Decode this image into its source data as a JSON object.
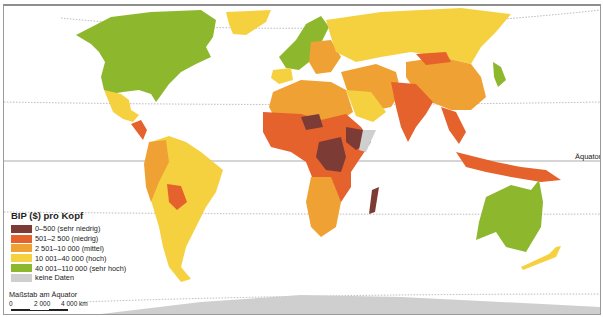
{
  "map": {
    "title": "BIP ($) pro Kopf",
    "equator_label": "Äquator",
    "legend": {
      "title": "BIP ($) pro Kopf",
      "items": [
        {
          "label": "0–500 (sehr niedrig)",
          "color": "#7d3b36"
        },
        {
          "label": "501–2 500 (niedrig)",
          "color": "#e5622c"
        },
        {
          "label": "2 501–10 000 (mittel)",
          "color": "#efa233"
        },
        {
          "label": "10 001–40 000 (hoch)",
          "color": "#f6d13f"
        },
        {
          "label": "40 001–110 000 (sehr hoch)",
          "color": "#8db82e"
        },
        {
          "label": "keine Daten",
          "color": "#cfcfcf"
        }
      ]
    },
    "scale": {
      "title": "Maßstab am Äquator",
      "ticks": [
        "0",
        "2 000",
        "4 000 km"
      ]
    },
    "colors": {
      "very_low": "#7d3b36",
      "low": "#e5622c",
      "medium": "#efa233",
      "high": "#f6d13f",
      "very_high": "#8db82e",
      "no_data": "#cfcfcf",
      "ocean": "#ffffff"
    }
  }
}
